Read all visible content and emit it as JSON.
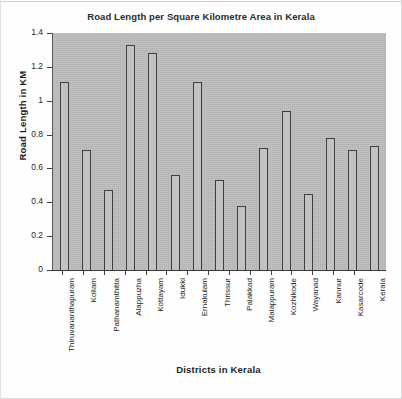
{
  "chart_data": {
    "type": "bar",
    "title": "Road Length per Square Kilometre Area in Kerala",
    "xlabel": "Districts in Kerala",
    "ylabel": "Road Length in KM",
    "categories": [
      "Thiruvananthapuram",
      "Kollam",
      "Pathanamthitta",
      "Alappuzha",
      "Kottayam",
      "Idukki",
      "Ernakulam",
      "Thrissur",
      "Palakkad",
      "Malappuram",
      "Kozhikode",
      "Wayanad",
      "Kannur",
      "Kasarcode",
      "Kerala"
    ],
    "values": [
      1.11,
      0.71,
      0.47,
      1.33,
      1.28,
      0.56,
      1.11,
      0.53,
      0.38,
      0.72,
      0.94,
      0.45,
      0.78,
      0.71,
      0.73
    ],
    "ylim": [
      0,
      1.4
    ],
    "yticks": [
      "0",
      "0.2",
      "0.4",
      "0.6",
      "0.8",
      "1",
      "1.2",
      "1.4"
    ],
    "ytick_values": [
      0,
      0.2,
      0.4,
      0.6,
      0.8,
      1.0,
      1.2,
      1.4
    ],
    "grid": false,
    "legend": false,
    "plot_background_color": "#bdbdbd",
    "bar_fill_color": "#c2c2c2",
    "bar_border_color": "#3f3f3f",
    "figure_background_color": "#fefefe"
  }
}
